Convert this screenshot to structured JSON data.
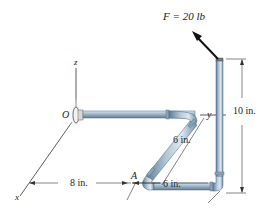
{
  "figure": {
    "force_label": "F = 20 lb",
    "origin_label": "O",
    "axis_x": "x",
    "axis_y": "y",
    "axis_z": "z",
    "point_a": "A",
    "dim_8in": "8 in.",
    "dim_6in_diag": "6 in.",
    "dim_6in_horiz": "6 in.",
    "dim_10in": "10 in."
  },
  "colors": {
    "pipe_light": "#b7c9d8",
    "pipe_mid": "#7f9bb3",
    "pipe_dark": "#4d6a82",
    "line": "#333333",
    "arrow": "#111111",
    "flange": "#c9c9c9"
  }
}
